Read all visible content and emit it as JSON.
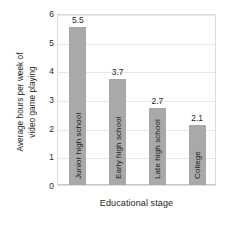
{
  "chart_data": {
    "type": "bar",
    "title": "",
    "subtitle": "",
    "xlabel": "Educational stage",
    "ylabel_lines": [
      "Average hours per week of",
      "video game playing"
    ],
    "ylabel": "Average hours per week of video game playing",
    "categories": [
      "Junior high school",
      "Early high school",
      "Late high school",
      "College"
    ],
    "values": [
      5.5,
      3.7,
      2.7,
      2.1
    ],
    "value_labels": [
      "5.5",
      "3.7",
      "2.7",
      "2.1"
    ],
    "ylim": [
      0,
      6
    ],
    "yticks": [
      0,
      1,
      2,
      3,
      4,
      5,
      6
    ],
    "ytick_labels": [
      "0",
      "1",
      "2",
      "3",
      "4",
      "5",
      "6"
    ],
    "grid": true,
    "grid_axis": "y",
    "legend": false,
    "legend_position": "none",
    "bar_color": "#a9a9a9",
    "background_color": "#ffffff",
    "frame_color": "#dcdcdc",
    "gridline_color": "#e8e8e8",
    "text_color": "#231f20",
    "category_label_placement": "inside-bar-rotated",
    "category_label_rotation": -90
  }
}
